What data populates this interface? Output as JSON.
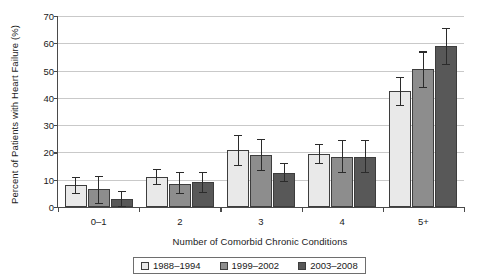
{
  "chart_data": {
    "type": "bar",
    "title": "",
    "xlabel": "Number of Comorbid Chronic Conditions",
    "ylabel": "Percent of Patients with Heart Failure (%)",
    "categories": [
      "0–1",
      "2",
      "3",
      "4",
      "5+"
    ],
    "ylim": [
      0,
      70
    ],
    "yticks": [
      0,
      10,
      20,
      30,
      40,
      50,
      60,
      70
    ],
    "grid": true,
    "legend_position": "bottom",
    "series": [
      {
        "name": "1988–1994",
        "color": "#e9e9e9",
        "values": [
          8.0,
          11.0,
          21.0,
          19.5,
          42.5
        ],
        "err_low": [
          5.0,
          8.5,
          15.5,
          16.0,
          37.5
        ],
        "err_high": [
          11.0,
          14.0,
          26.5,
          23.0,
          47.5
        ]
      },
      {
        "name": "1999–2002",
        "color": "#8d8d8d",
        "values": [
          6.5,
          8.5,
          19.0,
          18.5,
          50.5
        ],
        "err_low": [
          1.5,
          5.0,
          13.5,
          13.0,
          44.0
        ],
        "err_high": [
          11.5,
          13.0,
          25.0,
          24.5,
          57.0
        ]
      },
      {
        "name": "2003–2008",
        "color": "#585858",
        "values": [
          3.0,
          9.3,
          12.5,
          18.5,
          59.0
        ],
        "err_low": [
          0.5,
          5.5,
          9.5,
          13.0,
          52.5
        ],
        "err_high": [
          6.0,
          13.0,
          16.0,
          24.5,
          65.5
        ]
      }
    ]
  },
  "legend": {
    "entries": [
      "1988–1994",
      "1999–2002",
      "2003–2008"
    ]
  }
}
